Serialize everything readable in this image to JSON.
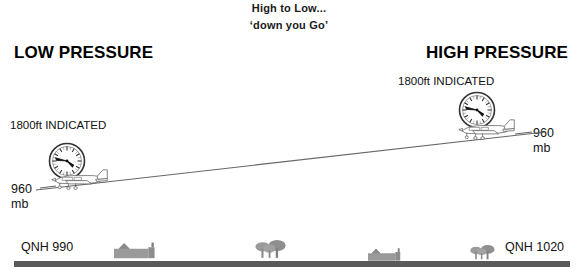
{
  "diagram": {
    "caption": {
      "line1": "High to Low...",
      "line2": "‘down you Go’"
    },
    "low_side": {
      "title": "LOW PRESSURE",
      "indicated_altitude": "1800ft INDICATED",
      "subscale_value": "960",
      "subscale_unit": "mb",
      "qnh": "QNH 990"
    },
    "high_side": {
      "title": "HIGH PRESSURE",
      "indicated_altitude": "1800ft INDICATED",
      "subscale_value": "960",
      "subscale_unit": "mb",
      "qnh": "QNH 1020"
    },
    "icons": {
      "left_altimeter": "altimeter-dial-icon",
      "right_altimeter": "altimeter-dial-icon",
      "left_aircraft": "light-aircraft-icon",
      "right_aircraft": "light-aircraft-icon",
      "flight_path": "flight-path-line",
      "ground": "ground-strip",
      "houses": [
        "house-icon",
        "house-icon"
      ],
      "trees": [
        "tree-cluster-icon",
        "tree-cluster-icon"
      ]
    },
    "colors": {
      "text": "#111111",
      "line_art": "#555555",
      "ground": "#5a5a5a",
      "scenery": "#8a8a8a",
      "background": "#ffffff"
    }
  }
}
